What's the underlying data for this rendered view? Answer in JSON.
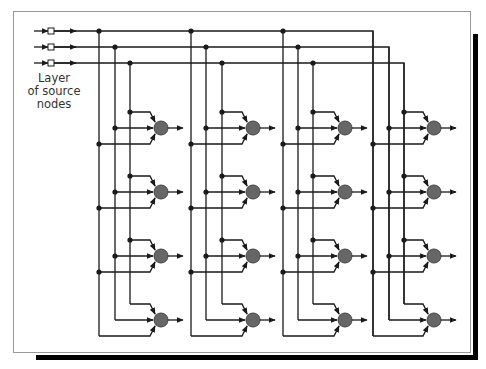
{
  "caption": {
    "lines": [
      "Layer",
      "of source",
      "nodes"
    ]
  },
  "colors": {
    "line": "#1a1a1a",
    "neuron_fill": "#666666",
    "neuron_stroke": "#444444",
    "frame": "#999999",
    "shadow": "#000000",
    "source_node_fill": "#ffffff"
  },
  "layout": {
    "frame": {
      "x": 13.5,
      "y": 11.5,
      "w": 457,
      "h": 341
    },
    "shadow_right": {
      "x": 473,
      "y": 34,
      "w": 5,
      "h": 326
    },
    "shadow_bottom": {
      "x": 36,
      "y": 355,
      "w": 442,
      "h": 5
    },
    "input_y": [
      31,
      47,
      63
    ],
    "input_start_x": 34,
    "source_node_x": 51,
    "column_verticals": [
      [
        99,
        115,
        130
      ],
      [
        191,
        206,
        222
      ],
      [
        283,
        298,
        313
      ],
      [
        373,
        389,
        404
      ]
    ],
    "neuron_x": [
      161,
      253,
      345,
      434
    ],
    "row_center_y": [
      128,
      192,
      256,
      320
    ],
    "neuron_radius": 7,
    "output_len": 21
  },
  "network": {
    "source_nodes": 3,
    "columns": 4,
    "rows": 4,
    "neurons": 16
  }
}
